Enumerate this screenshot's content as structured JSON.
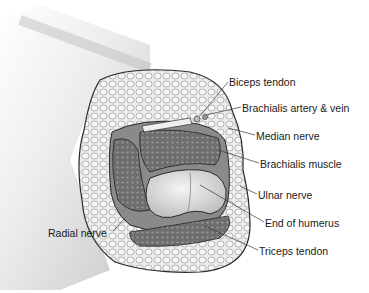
{
  "diagram": {
    "labels": [
      {
        "id": "biceps-tendon",
        "text": "Biceps tendon",
        "x": 229,
        "y": 76
      },
      {
        "id": "brachialis-artery-vein",
        "text": "Brachialis artery & vein",
        "x": 242,
        "y": 102
      },
      {
        "id": "median-nerve",
        "text": "Median nerve",
        "x": 256,
        "y": 130
      },
      {
        "id": "brachialis-muscle",
        "text": "Brachialis muscle",
        "x": 260,
        "y": 158
      },
      {
        "id": "ulnar-nerve",
        "text": "Ulnar nerve",
        "x": 258,
        "y": 189
      },
      {
        "id": "end-of-humerus",
        "text": "End of humerus",
        "x": 265,
        "y": 217
      },
      {
        "id": "triceps-tendon",
        "text": "Triceps tendon",
        "x": 259,
        "y": 245
      },
      {
        "id": "radial-nerve",
        "text": "Radial nerve",
        "x": 48,
        "y": 227
      }
    ],
    "colors": {
      "background": "#ffffff",
      "skin": "#d9d9d9",
      "fat": "#e8e8e8",
      "muscle": "#7a7a7a",
      "bone": "#d0d0d0",
      "outline": "#2a2a2a",
      "text": "#1a1a1a"
    }
  }
}
